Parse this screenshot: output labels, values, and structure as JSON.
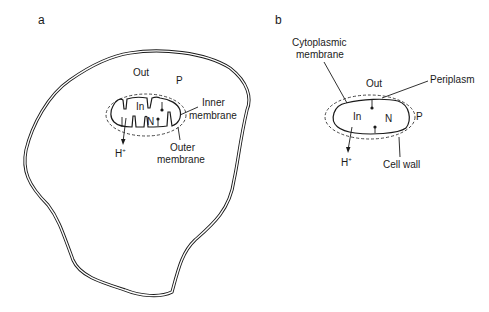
{
  "panels": {
    "a": {
      "label": "a",
      "description": "Eukaryotic cell containing a mitochondrion",
      "labels": {
        "out": "Out",
        "p": "P",
        "in": "In",
        "n": "N",
        "inner_membrane_line1": "Inner",
        "inner_membrane_line2": "membrane",
        "outer_membrane_line1": "Outer",
        "outer_membrane_line2": "membrane",
        "proton": "H",
        "proton_charge": "+"
      }
    },
    "b": {
      "label": "b",
      "description": "Bacterial cell",
      "labels": {
        "cytoplasmic_membrane_line1": "Cytoplasmic",
        "cytoplasmic_membrane_line2": "membrane",
        "out": "Out",
        "periplasm": "Periplasm",
        "in": "In",
        "n": "N",
        "p": "P",
        "proton": "H",
        "proton_charge": "+",
        "cell_wall": "Cell wall"
      }
    }
  },
  "colors": {
    "line": "#1a1a1a",
    "background": "#ffffff"
  }
}
